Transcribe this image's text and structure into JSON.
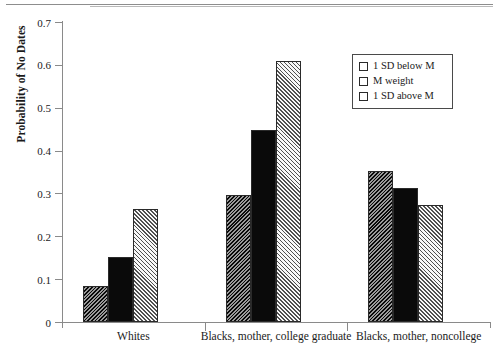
{
  "chart_data": {
    "type": "bar",
    "title": "",
    "xlabel": "",
    "ylabel": "Probability of No Dates",
    "ylim": [
      0,
      0.7
    ],
    "yticks": [
      "0",
      "0.1",
      "0.2",
      "0.3",
      "0.4",
      "0.5",
      "0.6",
      "0.7"
    ],
    "ytick_values": [
      0,
      0.1,
      0.2,
      0.3,
      0.4,
      0.5,
      0.6,
      0.7
    ],
    "grid": false,
    "legend_position": "upper right",
    "categories": [
      "Whites",
      "Blacks, mother, college graduate",
      "Blacks, mother, noncollege"
    ],
    "series": [
      {
        "name": "1 SD below M",
        "pattern": "backward-diagonal-hatch-dark",
        "values": [
          0.085,
          0.297,
          0.352
        ]
      },
      {
        "name": "M weight",
        "pattern": "solid-black",
        "values": [
          0.152,
          0.447,
          0.313
        ]
      },
      {
        "name": "1 SD above M",
        "pattern": "forward-diagonal-hatch-light",
        "values": [
          0.263,
          0.61,
          0.272
        ]
      }
    ]
  },
  "legend": {
    "items": [
      {
        "label": "1 SD below M"
      },
      {
        "label": "M weight"
      },
      {
        "label": "1 SD above M"
      }
    ]
  },
  "colors": {
    "axis": "#8a8a8a",
    "bar_outline": "#2a2a2a",
    "solid_bar": "#0a0a0a",
    "hatch_dark": "#6e6e6e",
    "hatch_light": "#cfcfcf",
    "text": "#1a1a1a"
  }
}
